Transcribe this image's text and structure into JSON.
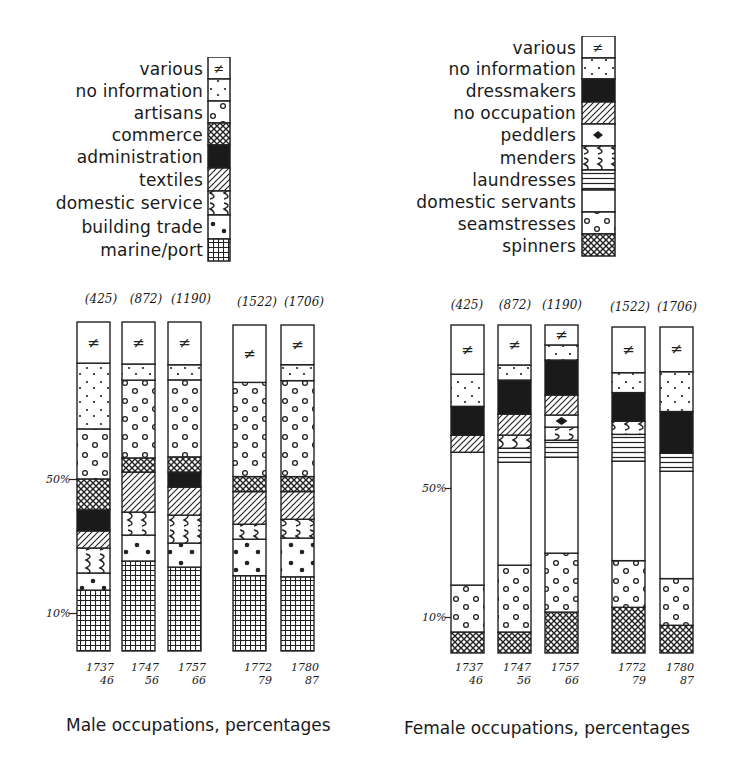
{
  "captions": {
    "male": "Male occupations, percentages",
    "female": "Female occupations, percentages"
  },
  "axis": {
    "tick_50": "50%",
    "tick_10": "10%"
  },
  "male_legend": [
    {
      "key": "various",
      "label": "various",
      "pattern": "neq"
    },
    {
      "key": "no_information",
      "label": "no information",
      "pattern": "small-dots"
    },
    {
      "key": "artisans",
      "label": "artisans",
      "pattern": "circles"
    },
    {
      "key": "commerce",
      "label": "commerce",
      "pattern": "crosshatch"
    },
    {
      "key": "administration",
      "label": "administration",
      "pattern": "solid-black"
    },
    {
      "key": "textiles",
      "label": "textiles",
      "pattern": "diagonal"
    },
    {
      "key": "domestic_service",
      "label": "domestic service",
      "pattern": "waves"
    },
    {
      "key": "building_trade",
      "label": "building trade",
      "pattern": "big-dots"
    },
    {
      "key": "marine_port",
      "label": "marine/port",
      "pattern": "grid"
    }
  ],
  "female_legend": [
    {
      "key": "various",
      "label": "various",
      "pattern": "neq"
    },
    {
      "key": "no_information",
      "label": "no information",
      "pattern": "small-dots"
    },
    {
      "key": "dressmakers",
      "label": "dressmakers",
      "pattern": "solid-black"
    },
    {
      "key": "no_occupation",
      "label": "no occupation",
      "pattern": "diagonal"
    },
    {
      "key": "peddlers",
      "label": "peddlers",
      "pattern": "diamond"
    },
    {
      "key": "menders",
      "label": "menders",
      "pattern": "waves"
    },
    {
      "key": "laundresses",
      "label": "laundresses",
      "pattern": "horizontal"
    },
    {
      "key": "domestic_servants",
      "label": "domestic servants",
      "pattern": "blank"
    },
    {
      "key": "seamstresses",
      "label": "seamstresses",
      "pattern": "circles"
    },
    {
      "key": "spinners",
      "label": "spinners",
      "pattern": "crosshatch"
    }
  ],
  "chart_data": [
    {
      "type": "bar",
      "stacked": true,
      "title": "Male occupations, percentages",
      "xlabel": "",
      "ylabel": "",
      "ylim": [
        0,
        100
      ],
      "y_ticks": [
        "10%",
        "50%"
      ],
      "grid": false,
      "legend_position": "top",
      "categories": [
        "1737-46",
        "1747-56",
        "1757-66",
        "1772-79",
        "1780-87"
      ],
      "category_labels": [
        {
          "line1": "1737",
          "line2": "46"
        },
        {
          "line1": "1747",
          "line2": "56"
        },
        {
          "line1": "1757",
          "line2": "66"
        },
        {
          "line1": "1772",
          "line2": "79"
        },
        {
          "line1": "1780",
          "line2": "87"
        }
      ],
      "n": [
        "(425)",
        "(872)",
        "(1190)",
        "(1522)",
        "(1706)"
      ],
      "series_order_bottom_to_top": [
        "marine_port",
        "building_trade",
        "domestic_service",
        "textiles",
        "administration",
        "commerce",
        "artisans",
        "no_information",
        "various"
      ],
      "series": [
        {
          "name": "marine/port",
          "key": "marine_port",
          "values": [
            18.5,
            27.4,
            25.5,
            23.1,
            22.8
          ]
        },
        {
          "name": "building trade",
          "key": "building_trade",
          "values": [
            5.2,
            7.9,
            7.3,
            11.2,
            11.9
          ]
        },
        {
          "name": "domestic service",
          "key": "domestic_service",
          "values": [
            7.6,
            7.0,
            8.5,
            4.6,
            5.8
          ]
        },
        {
          "name": "textiles",
          "key": "textiles",
          "values": [
            5.2,
            12.2,
            8.5,
            10.0,
            8.5
          ]
        },
        {
          "name": "administration",
          "key": "administration",
          "values": [
            6.4,
            0,
            4.6,
            0,
            0
          ]
        },
        {
          "name": "commerce",
          "key": "commerce",
          "values": [
            9.4,
            4.3,
            4.6,
            4.6,
            4.6
          ]
        },
        {
          "name": "artisans",
          "key": "artisans",
          "values": [
            15.2,
            23.7,
            23.4,
            28.9,
            29.5
          ]
        },
        {
          "name": "no information",
          "key": "no_information",
          "values": [
            20.0,
            4.9,
            4.6,
            0,
            4.9
          ]
        },
        {
          "name": "various",
          "key": "various",
          "values": [
            12.5,
            12.8,
            13.0,
            17.6,
            12.2
          ]
        }
      ]
    },
    {
      "type": "bar",
      "stacked": true,
      "title": "Female occupations, percentages",
      "xlabel": "",
      "ylabel": "",
      "ylim": [
        0,
        100
      ],
      "y_ticks": [
        "10%",
        "50%"
      ],
      "grid": false,
      "legend_position": "top",
      "categories": [
        "1737-46",
        "1747-56",
        "1757-66",
        "1772-79",
        "1780-87"
      ],
      "category_labels": [
        {
          "line1": "1737",
          "line2": "46"
        },
        {
          "line1": "1747",
          "line2": "56"
        },
        {
          "line1": "1757",
          "line2": "66"
        },
        {
          "line1": "1772",
          "line2": "79"
        },
        {
          "line1": "1780",
          "line2": "87"
        }
      ],
      "n": [
        "(425)",
        "(872)",
        "(1190)",
        "(1522)",
        "(1706)"
      ],
      "series_order_bottom_to_top": [
        "spinners",
        "seamstresses",
        "domestic_servants",
        "laundresses",
        "menders",
        "peddlers",
        "no_occupation",
        "dressmakers",
        "no_information",
        "various"
      ],
      "series": [
        {
          "name": "spinners",
          "key": "spinners",
          "values": [
            6.4,
            6.4,
            12.5,
            14.0,
            8.5
          ]
        },
        {
          "name": "seamstresses",
          "key": "seamstresses",
          "values": [
            14.3,
            20.4,
            18.0,
            14.3,
            14.3
          ]
        },
        {
          "name": "domestic servants",
          "key": "domestic_servants",
          "values": [
            40.5,
            31.4,
            29.3,
            30.5,
            32.9
          ]
        },
        {
          "name": "laundresses",
          "key": "laundresses",
          "values": [
            0,
            4.3,
            5.2,
            8.2,
            5.5
          ]
        },
        {
          "name": "menders",
          "key": "menders",
          "values": [
            0,
            4.0,
            4.0,
            4.0,
            0
          ]
        },
        {
          "name": "peddlers",
          "key": "peddlers",
          "values": [
            0,
            0,
            3.7,
            0,
            0
          ]
        },
        {
          "name": "no occupation",
          "key": "no_occupation",
          "values": [
            5.2,
            6.4,
            6.1,
            0,
            0
          ]
        },
        {
          "name": "dressmakers",
          "key": "dressmakers",
          "values": [
            8.8,
            10.4,
            10.7,
            8.8,
            12.8
          ]
        },
        {
          "name": "no information",
          "key": "no_information",
          "values": [
            9.8,
            4.6,
            4.6,
            6.1,
            12.2
          ]
        },
        {
          "name": "various",
          "key": "various",
          "values": [
            15.0,
            12.2,
            6.1,
            14.0,
            13.7
          ]
        }
      ]
    }
  ]
}
